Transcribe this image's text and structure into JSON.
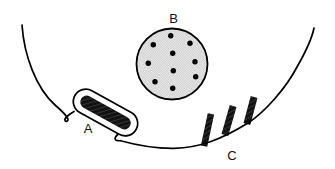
{
  "diagram": {
    "labels": {
      "a": "A",
      "b": "B",
      "c": "C"
    },
    "colors": {
      "line": "#000000",
      "background": "#ffffff",
      "vesicle_fill_light": "#f0f0f0",
      "vesicle_fill_dot": "#c9c9c9",
      "structure_dark": "#121212",
      "label_text": "#111111"
    },
    "vesicle_b": {
      "cx": 172,
      "cy": 64,
      "r": 35.5,
      "dot_radius": 2.7,
      "dots": [
        [
          170.7,
          35.7
        ],
        [
          153.3,
          44.7
        ],
        [
          190.0,
          43.3
        ],
        [
          172.7,
          53.3
        ],
        [
          148.3,
          63.3
        ],
        [
          195.0,
          61.7
        ],
        [
          173.3,
          70.7
        ],
        [
          155.0,
          81.7
        ],
        [
          195.7,
          76.7
        ],
        [
          172.7,
          88.3
        ]
      ]
    },
    "rod_a": {
      "cx": 105.5,
      "cy": 112.5,
      "length": 56,
      "width": 13,
      "angle": 29,
      "pocket_length": 70,
      "pocket_width": 25
    },
    "bars_c": [
      {
        "cx": 207.5,
        "cy": 130.0,
        "w": 6.5,
        "h": 33,
        "angle": 12
      },
      {
        "cx": 229.0,
        "cy": 120.5,
        "w": 7.0,
        "h": 30,
        "angle": 16
      },
      {
        "cx": 250.5,
        "cy": 110.5,
        "w": 7.0,
        "h": 28,
        "angle": 15
      }
    ]
  }
}
